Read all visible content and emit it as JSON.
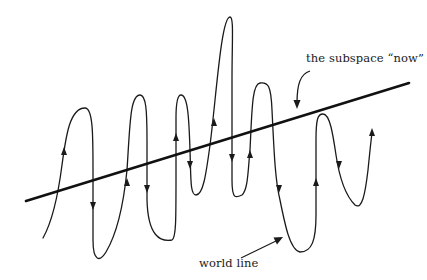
{
  "diagram": {
    "labels": {
      "subspace_now": "the subspace “now”",
      "world_line": "world line"
    },
    "elements": {
      "now_line": {
        "description": "straight thick line representing the subspace now",
        "from": [
          26,
          201
        ],
        "to": [
          409,
          83
        ],
        "color": "#111111"
      },
      "world_line": {
        "description": "oscillating curve crossing the now line repeatedly, with direction arrows",
        "color": "#1a1a1a",
        "arrows": [
          {
            "x": 64,
            "y": 152,
            "dir": "up"
          },
          {
            "x": 93,
            "y": 205,
            "dir": "down"
          },
          {
            "x": 127,
            "y": 183,
            "dir": "up"
          },
          {
            "x": 147,
            "y": 188,
            "dir": "down"
          },
          {
            "x": 176,
            "y": 138,
            "dir": "up"
          },
          {
            "x": 190,
            "y": 164,
            "dir": "down"
          },
          {
            "x": 213,
            "y": 123,
            "dir": "up"
          },
          {
            "x": 232,
            "y": 157,
            "dir": "down"
          },
          {
            "x": 250,
            "y": 155,
            "dir": "up"
          },
          {
            "x": 279,
            "y": 188,
            "dir": "down"
          },
          {
            "x": 316,
            "y": 183,
            "dir": "up"
          },
          {
            "x": 339,
            "y": 164,
            "dir": "down"
          },
          {
            "x": 372,
            "y": 133,
            "dir": "up"
          }
        ]
      },
      "pointer_now": {
        "description": "curved arrow from 'the subspace now' label pointing down to the line",
        "color": "#1a1a1a"
      },
      "pointer_world": {
        "description": "straight arrow from 'world line' label pointing to the curve",
        "color": "#1a1a1a"
      }
    }
  }
}
